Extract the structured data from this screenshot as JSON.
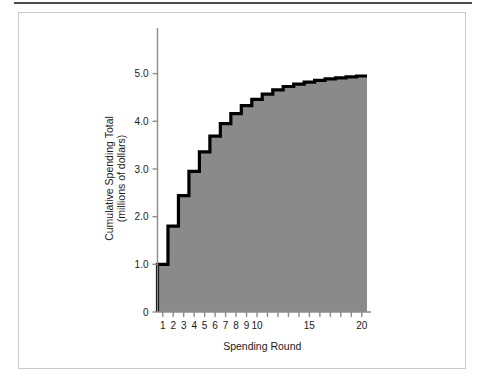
{
  "figure": {
    "background_color": "#ffffff",
    "border_color": "#c9c9c9",
    "rule_color": "#4a4a4a"
  },
  "chart_data": {
    "type": "area",
    "subtype": "step-area",
    "title": "",
    "xlabel": "Spending Round",
    "ylabel": "Cumulative Spending Total\n(millions of dollars)",
    "ylabel_line1": "Cumulative Spending Total",
    "ylabel_line2": "(millions of dollars)",
    "x": [
      1,
      2,
      3,
      4,
      5,
      6,
      7,
      8,
      9,
      10,
      11,
      12,
      13,
      14,
      15,
      16,
      17,
      18,
      19,
      20
    ],
    "values": [
      1.0,
      1.8,
      2.44,
      2.95,
      3.36,
      3.69,
      3.95,
      4.16,
      4.33,
      4.46,
      4.57,
      4.66,
      4.73,
      4.78,
      4.82,
      4.86,
      4.89,
      4.91,
      4.93,
      4.95
    ],
    "increments": [
      1.0,
      0.8,
      0.64,
      0.51,
      0.41,
      0.33,
      0.26,
      0.21,
      0.17,
      0.13,
      0.11,
      0.09,
      0.07,
      0.05,
      0.04,
      0.04,
      0.03,
      0.02,
      0.02,
      0.02
    ],
    "xlim": [
      0.5,
      20.5
    ],
    "ylim": [
      0,
      5.6
    ],
    "xticks": [
      1,
      2,
      3,
      4,
      5,
      6,
      7,
      8,
      9,
      10,
      11,
      12,
      13,
      14,
      15,
      16,
      17,
      18,
      19,
      20
    ],
    "xtick_labels": [
      "1",
      "2",
      "3",
      "4",
      "5",
      "6",
      "7",
      "8",
      "9",
      "10",
      "",
      "",
      "",
      "",
      "15",
      "",
      "",
      "",
      "",
      "20"
    ],
    "yticks": [
      0,
      1.0,
      2.0,
      3.0,
      4.0,
      5.0
    ],
    "ytick_labels": [
      "0",
      "1.0",
      "2.0",
      "3.0",
      "4.0",
      "5.0"
    ],
    "grid": false,
    "legend": "none",
    "fill_color": "#8a8a8a",
    "line_color": "#000000",
    "axis_color": "#8c8c8c",
    "line_width": 3.2
  }
}
